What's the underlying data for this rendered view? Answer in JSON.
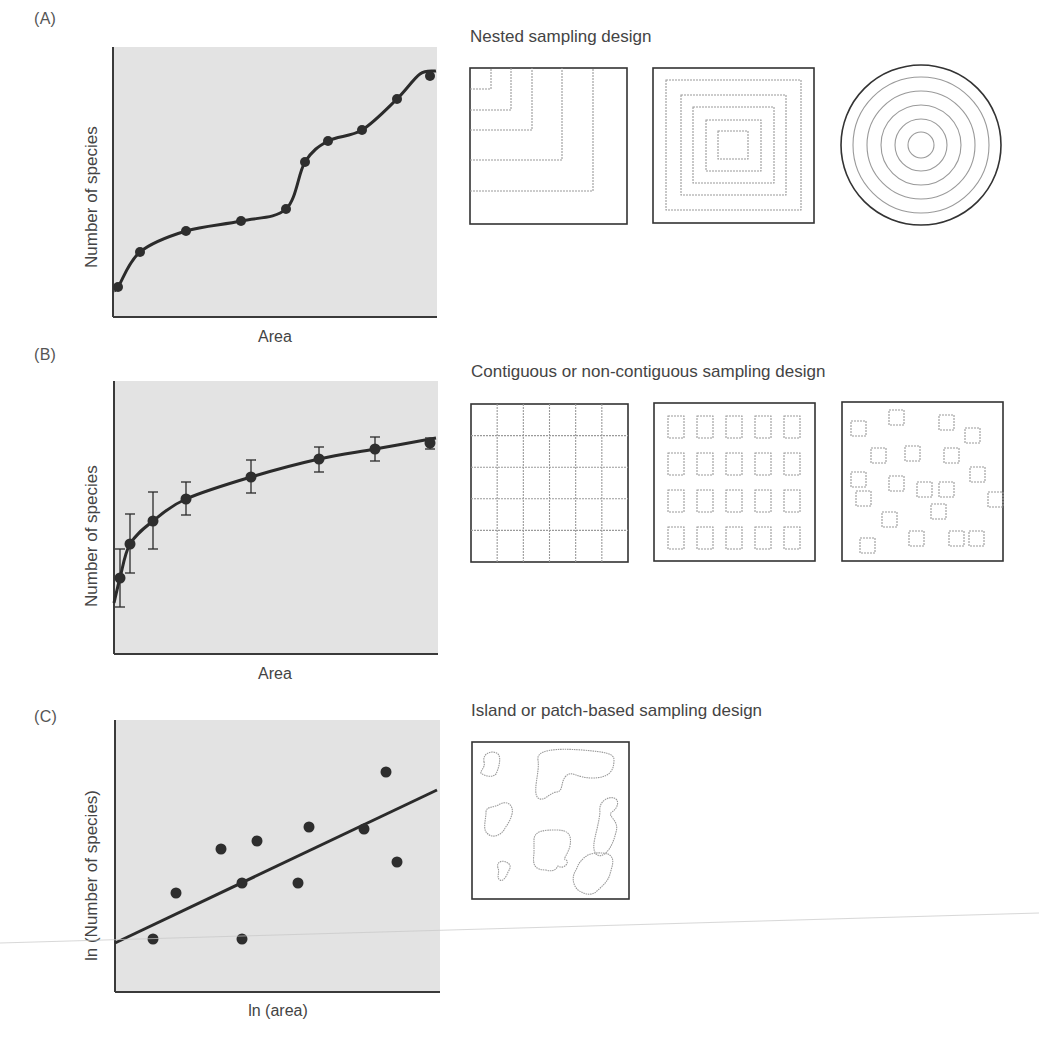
{
  "colors": {
    "plot_bg": "#e3e3e3",
    "axis": "#3a3a3a",
    "curve": "#2b2b2b",
    "point": "#2e2e2e",
    "design_border": "#333333",
    "design_inner": "#9a9a9a",
    "artifact": "#c8c8c8"
  },
  "panels": [
    {
      "id": "A",
      "label": "(A)",
      "design_title": "Nested sampling design"
    },
    {
      "id": "B",
      "label": "(B)",
      "design_title": "Contiguous or non-contiguous sampling design"
    },
    {
      "id": "C",
      "label": "(C)",
      "design_title": "Island or patch-based sampling design"
    }
  ],
  "chart_data": [
    {
      "panel": "A",
      "type": "line",
      "title": "",
      "xlabel": "Area",
      "ylabel": "Number of species",
      "ticks": "none",
      "grid": false,
      "legend": null,
      "x": [
        0.01,
        0.08,
        0.23,
        0.4,
        0.54,
        0.6,
        0.67,
        0.77,
        0.88,
        0.98
      ],
      "values": [
        0.11,
        0.24,
        0.32,
        0.36,
        0.4,
        0.58,
        0.65,
        0.7,
        0.81,
        0.89
      ],
      "note": "Normalized 0-1 positions; curve is a smooth step-like fit through points (no numeric axis scale shown)",
      "plot_px": {
        "left": 113,
        "top": 47,
        "right": 437,
        "bottom": 317
      },
      "points_px": [
        [
          118,
          287
        ],
        [
          140,
          252
        ],
        [
          186,
          231
        ],
        [
          241,
          221
        ],
        [
          286,
          209
        ],
        [
          305,
          162
        ],
        [
          328,
          141
        ],
        [
          362,
          130
        ],
        [
          397,
          99
        ],
        [
          430,
          76
        ]
      ]
    },
    {
      "panel": "B",
      "type": "line",
      "title": "",
      "xlabel": "Area",
      "ylabel": "Number of species",
      "ticks": "none",
      "grid": false,
      "legend": null,
      "x": [
        0.02,
        0.05,
        0.12,
        0.22,
        0.42,
        0.63,
        0.8,
        0.97
      ],
      "values": [
        0.28,
        0.4,
        0.49,
        0.57,
        0.65,
        0.71,
        0.75,
        0.77
      ],
      "error_low": [
        0.17,
        0.3,
        0.38,
        0.51,
        0.59,
        0.67,
        0.71,
        0.75
      ],
      "error_high": [
        0.38,
        0.51,
        0.59,
        0.63,
        0.71,
        0.76,
        0.79,
        0.79
      ],
      "note": "Normalized 0-1 positions; saturating (log-like) fitted curve with error bars",
      "plot_px": {
        "left": 114,
        "top": 381,
        "right": 438,
        "bottom": 654
      },
      "points_px": [
        [
          120,
          578,
          549,
          607
        ],
        [
          130,
          544,
          514,
          573
        ],
        [
          153,
          521,
          492,
          549
        ],
        [
          186,
          499,
          482,
          515
        ],
        [
          251,
          477,
          460,
          493
        ],
        [
          319,
          459,
          447,
          472
        ],
        [
          375,
          449,
          437,
          461
        ],
        [
          430,
          443,
          438,
          449
        ]
      ]
    },
    {
      "panel": "C",
      "type": "scatter",
      "title": "",
      "xlabel": "ln (area)",
      "ylabel": "ln (Number of species)",
      "ticks": "none",
      "grid": false,
      "legend": null,
      "x": [
        0.12,
        0.19,
        0.33,
        0.39,
        0.44,
        0.56,
        0.6,
        0.77,
        0.84,
        0.87,
        0.39
      ],
      "values": [
        0.19,
        0.36,
        0.52,
        0.4,
        0.55,
        0.4,
        0.61,
        0.6,
        0.81,
        0.48,
        0.19
      ],
      "regression_line": {
        "x": [
          0.0,
          0.99
        ],
        "y": [
          0.18,
          0.74
        ]
      },
      "note": "Normalized 0-1 positions; linear fit on log-log axes",
      "plot_px": {
        "left": 115,
        "top": 720,
        "right": 440,
        "bottom": 992
      },
      "points_px": [
        [
          153,
          939
        ],
        [
          176,
          893
        ],
        [
          221,
          849
        ],
        [
          242,
          883
        ],
        [
          257,
          841
        ],
        [
          298,
          883
        ],
        [
          309,
          827
        ],
        [
          364,
          829
        ],
        [
          386,
          772
        ],
        [
          397,
          862
        ],
        [
          242,
          939
        ]
      ],
      "line_px": [
        [
          115,
          943
        ],
        [
          437,
          790
        ]
      ]
    }
  ],
  "designs": {
    "nested": {
      "corner_squares": {
        "box": [
          470,
          68,
          157,
          156
        ],
        "corners": [
          [
            21,
            21
          ],
          [
            41,
            42
          ],
          [
            62,
            62
          ],
          [
            92,
            92
          ],
          [
            123,
            123
          ]
        ]
      },
      "concentric_squares": {
        "box": [
          653,
          68,
          161,
          155
        ],
        "insets": [
          [
            13,
            12,
            135,
            130
          ],
          [
            28,
            27,
            105,
            100
          ],
          [
            40,
            39,
            81,
            76
          ],
          [
            53,
            52,
            55,
            51
          ],
          [
            65,
            63,
            30,
            28
          ]
        ]
      },
      "concentric_circles": {
        "cx": 921,
        "cy": 145,
        "r_outer": 80,
        "r_inner": [
          68,
          54,
          40,
          26,
          13
        ]
      }
    },
    "contiguous": {
      "grid": {
        "box": [
          471,
          404,
          157,
          158
        ],
        "cols": 6,
        "rows": 5
      },
      "regular_quadrats": {
        "box": [
          654,
          403,
          161,
          158
        ],
        "xs": [
          14,
          43,
          72,
          101,
          130
        ],
        "ys": [
          13,
          50,
          87,
          124
        ],
        "w": 16,
        "h": 22
      },
      "random_quadrats": {
        "box": [
          842,
          402,
          161,
          159
        ],
        "size": 15,
        "squares": [
          [
            851,
            421
          ],
          [
            889,
            410
          ],
          [
            939,
            415
          ],
          [
            965,
            428
          ],
          [
            871,
            448
          ],
          [
            905,
            446
          ],
          [
            944,
            448
          ],
          [
            970,
            467
          ],
          [
            851,
            472
          ],
          [
            889,
            476
          ],
          [
            917,
            482
          ],
          [
            939,
            482
          ],
          [
            988,
            492
          ],
          [
            856,
            491
          ],
          [
            882,
            512
          ],
          [
            931,
            504
          ],
          [
            860,
            538
          ],
          [
            909,
            531
          ],
          [
            949,
            531
          ],
          [
            969,
            531
          ]
        ]
      }
    },
    "island": {
      "box": [
        472,
        742,
        157,
        157
      ],
      "patches": [
        "M12,20 C10,10 22,8 26,12 C30,16 26,28 24,32 C20,36 14,34 10,32 C6,30 14,26 12,20 Z",
        "M66,18 C64,8 82,6 110,8 C136,10 142,12 142,18 C142,30 136,36 120,36 C104,36 100,28 94,34 C88,40 92,50 84,50 C76,52 72,60 66,56 C60,50 68,30 66,18 Z",
        "M14,70 C14,64 22,66 28,62 C36,58 42,64 40,72 C38,80 34,84 32,88 C28,94 20,96 16,92 C10,88 14,78 14,70 Z",
        "M128,70 C126,60 136,54 142,56 C148,58 146,66 140,70 C134,74 148,78 144,90 C140,108 130,118 124,112 C118,104 126,90 128,70 Z",
        "M62,98 C62,88 74,88 84,88 C96,88 100,92 98,104 C96,112 90,118 94,118 C98,120 92,128 86,124 C84,128 80,130 74,128 C64,128 60,124 62,112 Z",
        "M26,126 C24,120 30,118 34,120 C38,122 40,124 36,130 C34,136 30,140 28,138 C24,136 28,130 26,126 Z",
        "M110,118 C116,110 128,110 136,112 C144,116 140,124 138,132 C136,140 130,144 124,150 C118,154 112,152 106,148 C100,142 100,134 104,128 C106,124 106,122 110,118 Z"
      ]
    }
  },
  "artifact_line": {
    "x1": 0,
    "y1": 943,
    "x2": 1039,
    "y2": 913
  }
}
